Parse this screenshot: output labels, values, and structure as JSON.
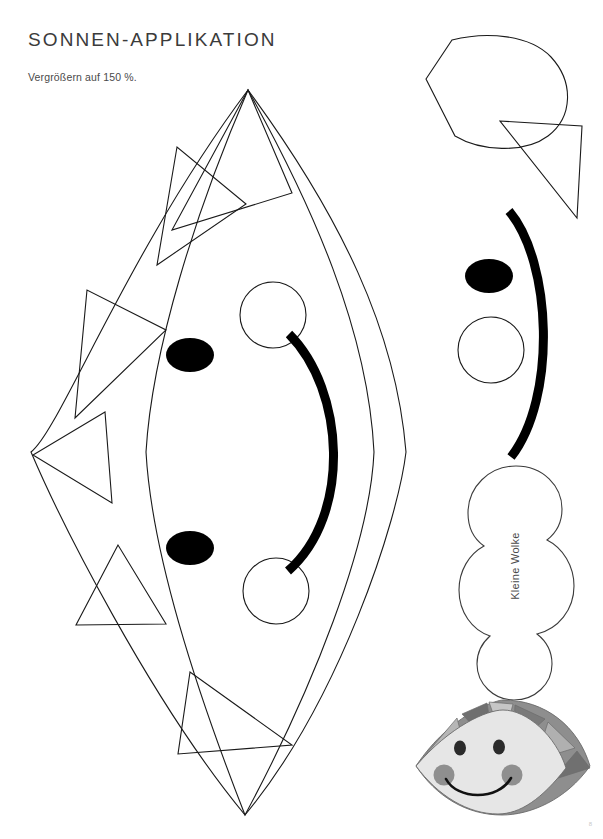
{
  "document": {
    "title": "SONNEN-APPLIKATION",
    "subtitle": "Vergrößern auf 150 %.",
    "page_number": "8",
    "background_color": "#ffffff",
    "ink_color": "#1a1a1a",
    "title_color": "#3b3b3b"
  },
  "labels": {
    "cloud": "Kleine Wolke"
  },
  "template_pieces": {
    "sun_body": {
      "name": "Sonne",
      "description": "lens-shaped sun body with triangular rays",
      "stroke": "#1a1a1a",
      "fill": "none",
      "outer_points": {
        "top_x": 248,
        "top_y": 90,
        "bottom_x": 245,
        "bottom_y": 815,
        "left_x": 31,
        "right_x": 406
      },
      "ray_count": 6
    },
    "petal": {
      "name": "Strahl (Tropfen)",
      "stroke": "#1a1a1a"
    },
    "triangle_ray": {
      "name": "Strahl (Dreieck)",
      "stroke": "#1a1a1a"
    },
    "eye": {
      "name": "Auge",
      "fill": "#000000",
      "rx": 24,
      "ry": 17
    },
    "cheek": {
      "name": "Wange",
      "fill": "none",
      "stroke": "#1a1a1a",
      "r": 33
    },
    "mouth": {
      "name": "Mund",
      "stroke": "#000000",
      "stroke_width": 9
    },
    "cloud": {
      "name": "Kleine Wolke",
      "stroke": "#3b3b3b",
      "fill": "none"
    }
  },
  "preview": {
    "name": "Sonnengesicht Vorschau",
    "colors": {
      "face": "#ececec",
      "ray_dark": "#7d7d7d",
      "ray_mid": "#9b9b9b",
      "ray_light": "#bdbdbd",
      "cheek": "#8f8f8f",
      "eye": "#2b2b2b",
      "outline": "#6b6b6b",
      "mouth": "#111111"
    }
  }
}
